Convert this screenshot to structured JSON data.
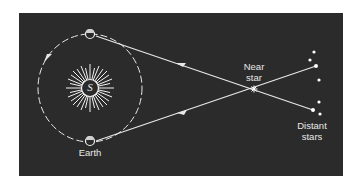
{
  "diagram": {
    "labels": {
      "sun": "S",
      "earth": "Earth",
      "near_star_line1": "Near",
      "near_star_line2": "star",
      "distant_stars_line1": "Distant",
      "distant_stars_line2": "stars"
    },
    "colors": {
      "background": "#2b2b2b",
      "foreground": "#e8e8e8",
      "page": "#ffffff"
    },
    "elements": [
      {
        "id": "sun",
        "type": "star-burst",
        "label": "S"
      },
      {
        "id": "orbit",
        "type": "dashed-ellipse",
        "direction": "counter-clockwise"
      },
      {
        "id": "earth-top",
        "type": "planet"
      },
      {
        "id": "earth-bottom",
        "type": "planet",
        "label": "Earth"
      },
      {
        "id": "near-star",
        "type": "star",
        "label": "Near star"
      },
      {
        "id": "distant-stars",
        "type": "star-cluster",
        "count": 7,
        "label": "Distant stars"
      },
      {
        "id": "sightline-1",
        "type": "arrow-line",
        "from": "distant-stars-lower",
        "to": "earth-top",
        "via": "near-star"
      },
      {
        "id": "sightline-2",
        "type": "arrow-line",
        "from": "distant-stars-upper",
        "to": "earth-bottom",
        "via": "near-star"
      }
    ]
  }
}
